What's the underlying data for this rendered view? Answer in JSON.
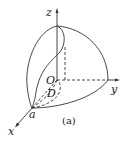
{
  "figure": {
    "labels": {
      "z": "z",
      "y": "y",
      "x": "x",
      "origin": "O",
      "region": "D",
      "point_a": "a"
    },
    "caption": "(a)",
    "colors": {
      "stroke": "#333333",
      "background": "#ffffff"
    }
  }
}
